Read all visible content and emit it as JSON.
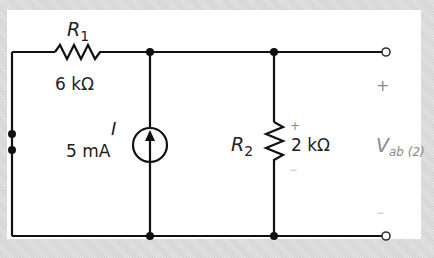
{
  "diagram": {
    "type": "circuit",
    "components": {
      "r1": {
        "symbol": "R",
        "subscript": "1",
        "value": "6 kΩ"
      },
      "current_source": {
        "symbol": "I",
        "value": "5 mA",
        "direction": "up"
      },
      "r2": {
        "symbol": "R",
        "subscript": "2",
        "value": "2 kΩ",
        "plus": "+",
        "minus": "—"
      }
    },
    "output": {
      "label_main": "V",
      "label_sub": "ab (2)",
      "plus": "+",
      "minus": "—"
    },
    "colors": {
      "wire": "#111111",
      "label": "#222222",
      "output_label": "#8a8a8a",
      "background": "#ffffff",
      "frame": "#d9d9d9"
    }
  }
}
